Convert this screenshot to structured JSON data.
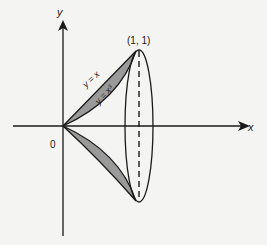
{
  "diagram": {
    "axes": {
      "x_label": "x",
      "y_label": "y",
      "origin_label": "0"
    },
    "point_label": "(1, 1)",
    "curves": [
      {
        "name": "line",
        "label": "y = x"
      },
      {
        "name": "cubic",
        "label": "y = x³"
      }
    ],
    "colors": {
      "shaded_region": "#9a9a9a",
      "stroke": "#1a1a1a",
      "background": "#f4f4f2"
    }
  }
}
